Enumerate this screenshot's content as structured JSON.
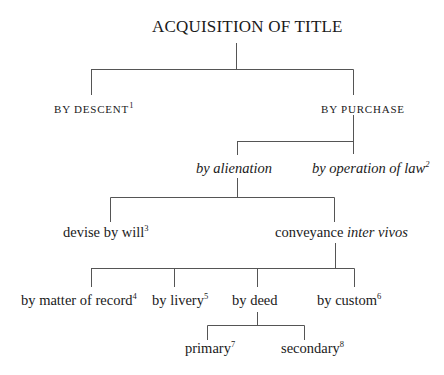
{
  "diagram": {
    "type": "tree",
    "title": "ACQUISITION OF TITLE",
    "nodes": {
      "root": {
        "label": "ACQUISITION OF TITLE"
      },
      "descent": {
        "label": "BY DESCENT",
        "note": "1"
      },
      "purchase": {
        "label": "BY PURCHASE"
      },
      "alienation": {
        "label": "by alienation"
      },
      "operation_of_law": {
        "label": "by operation of law",
        "note": "2"
      },
      "devise": {
        "label": "devise by will",
        "note": "3"
      },
      "conveyance": {
        "label_plain": "conveyance ",
        "label_italic": "inter vivos"
      },
      "matter_of_record": {
        "label": "by matter of record",
        "note": "4"
      },
      "livery": {
        "label": "by livery",
        "note": "5"
      },
      "deed": {
        "label": "by deed"
      },
      "custom": {
        "label": "by custom",
        "note": "6"
      },
      "primary": {
        "label": "primary",
        "note": "7"
      },
      "secondary": {
        "label": "secondary",
        "note": "8"
      }
    },
    "edges": [
      [
        "root",
        "descent"
      ],
      [
        "root",
        "purchase"
      ],
      [
        "purchase",
        "alienation"
      ],
      [
        "purchase",
        "operation_of_law"
      ],
      [
        "alienation",
        "devise"
      ],
      [
        "alienation",
        "conveyance"
      ],
      [
        "conveyance",
        "matter_of_record"
      ],
      [
        "conveyance",
        "livery"
      ],
      [
        "conveyance",
        "deed"
      ],
      [
        "conveyance",
        "custom"
      ],
      [
        "deed",
        "primary"
      ],
      [
        "deed",
        "secondary"
      ]
    ],
    "line_color": "#555555"
  }
}
